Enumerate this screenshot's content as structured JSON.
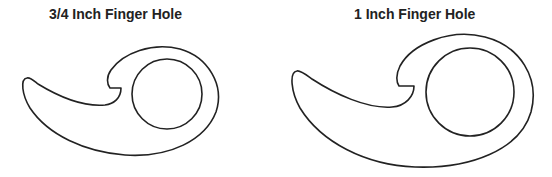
{
  "figures": [
    {
      "title": "3/4 Inch Finger Hole"
    },
    {
      "title": "1 Inch Finger Hole"
    }
  ],
  "colors": {
    "stroke": "#222222",
    "background": "#ffffff"
  }
}
